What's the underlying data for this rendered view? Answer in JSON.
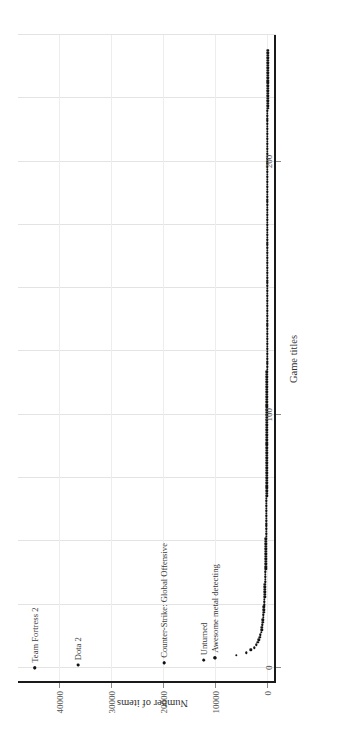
{
  "chart_data": {
    "type": "scatter",
    "title": "",
    "xlabel": "Game titles",
    "ylabel": "Number of items",
    "xlim": [
      -6,
      250
    ],
    "ylim": [
      -1500,
      48000
    ],
    "xticks": [
      0,
      100,
      200
    ],
    "xticklabels": [
      "0",
      "100",
      "200"
    ],
    "yticks": [
      0,
      10000,
      20000,
      30000,
      40000
    ],
    "yticklabels": [
      "0",
      "10000",
      "20000",
      "30000",
      "40000"
    ],
    "grid": true,
    "legend": null,
    "orientation": "rotated-90-clockwise",
    "annotations": [
      {
        "label": "Team Fortress 2",
        "x": 0,
        "y": 44800
      },
      {
        "label": "Dota 2",
        "x": 1,
        "y": 36400
      },
      {
        "label": "Counter-Strike: Global Offensive",
        "x": 2,
        "y": 19900
      },
      {
        "label": "Unturned",
        "x": 3,
        "y": 12400
      },
      {
        "label": "Awesome metal detecting",
        "x": 4,
        "y": 10200
      }
    ],
    "x": [
      0,
      1,
      2,
      3,
      4,
      5,
      6,
      7,
      8,
      9,
      10,
      11,
      12,
      13,
      14,
      15,
      16,
      17,
      18,
      19,
      20,
      21,
      22,
      23,
      24,
      25,
      26,
      27,
      28,
      29,
      30,
      31,
      32,
      33,
      34,
      35,
      36,
      37,
      38,
      39,
      40,
      41,
      42,
      43,
      44,
      45,
      46,
      47,
      48,
      49,
      50,
      51,
      52,
      53,
      54,
      55,
      56,
      57,
      58,
      59,
      60,
      61,
      62,
      63,
      64,
      65,
      66,
      67,
      68,
      69,
      70,
      71,
      72,
      73,
      74,
      75,
      76,
      77,
      78,
      79,
      80,
      81,
      82,
      83,
      84,
      85,
      86,
      87,
      88,
      89,
      90,
      91,
      92,
      93,
      94,
      95,
      96,
      97,
      98,
      99,
      100,
      101,
      102,
      103,
      104,
      105,
      106,
      107,
      108,
      109,
      110,
      111,
      112,
      113,
      114,
      115,
      116,
      117,
      118,
      119,
      120,
      121,
      122,
      123,
      124,
      125,
      126,
      127,
      128,
      129,
      130,
      131,
      132,
      133,
      134,
      135,
      136,
      137,
      138,
      139,
      140,
      141,
      142,
      143,
      144,
      145,
      146,
      147,
      148,
      149,
      150,
      151,
      152,
      153,
      154,
      155,
      156,
      157,
      158,
      159,
      160,
      161,
      162,
      163,
      164,
      165,
      166,
      167,
      168,
      169,
      170,
      171,
      172,
      173,
      174,
      175,
      176,
      177,
      178,
      179,
      180,
      181,
      182,
      183,
      184,
      185,
      186,
      187,
      188,
      189,
      190,
      191,
      192,
      193,
      194,
      195,
      196,
      197,
      198,
      199,
      200,
      201,
      202,
      203,
      204,
      205,
      206,
      207,
      208,
      209,
      210,
      211,
      212,
      213,
      214,
      215,
      216,
      217,
      218,
      219,
      220,
      221,
      222,
      223,
      224,
      225,
      226,
      227,
      228,
      229,
      230,
      231,
      232,
      233,
      234,
      235,
      236,
      237,
      238,
      239,
      240,
      241,
      242,
      243,
      244
    ],
    "y": [
      44800,
      36400,
      19900,
      12400,
      10200,
      6100,
      4200,
      3300,
      2700,
      2300,
      2000,
      1800,
      1620,
      1480,
      1360,
      1260,
      1180,
      1110,
      1050,
      1000,
      950,
      905,
      865,
      830,
      798,
      768,
      740,
      715,
      692,
      670,
      650,
      631,
      613,
      596,
      580,
      565,
      551,
      538,
      525,
      513,
      502,
      491,
      481,
      471,
      462,
      453,
      445,
      437,
      429,
      422,
      415,
      408,
      401,
      395,
      389,
      383,
      378,
      372,
      367,
      362,
      357,
      352,
      348,
      343,
      339,
      335,
      331,
      327,
      323,
      319,
      316,
      312,
      309,
      305,
      302,
      299,
      296,
      293,
      290,
      287,
      284,
      281,
      279,
      276,
      273,
      271,
      268,
      266,
      264,
      261,
      259,
      257,
      255,
      253,
      251,
      249,
      247,
      245,
      243,
      241,
      239,
      237,
      235,
      234,
      232,
      230,
      229,
      227,
      225,
      224,
      222,
      221,
      219,
      218,
      216,
      215,
      214,
      212,
      211,
      210,
      208,
      207,
      206,
      205,
      203,
      202,
      201,
      200,
      199,
      198,
      196,
      195,
      194,
      193,
      192,
      191,
      190,
      189,
      188,
      187,
      186,
      185,
      184,
      183,
      182,
      181,
      180,
      180,
      179,
      178,
      177,
      176,
      175,
      174,
      174,
      173,
      172,
      171,
      170,
      170,
      169,
      168,
      167,
      167,
      166,
      165,
      164,
      164,
      163,
      162,
      162,
      161,
      160,
      160,
      159,
      158,
      158,
      157,
      156,
      156,
      155,
      154,
      154,
      153,
      153,
      152,
      151,
      151,
      150,
      150,
      149,
      148,
      148,
      147,
      147,
      146,
      146,
      145,
      145,
      144,
      144,
      143,
      143,
      142,
      142,
      141,
      141,
      140,
      140,
      139,
      139,
      138,
      138,
      137,
      137,
      136,
      136,
      135,
      135,
      134,
      134,
      133,
      133,
      133,
      132,
      132,
      131,
      131,
      130,
      130,
      130,
      129,
      129,
      128,
      128,
      128,
      127,
      127,
      126,
      126,
      126,
      125,
      125,
      125,
      124
    ]
  }
}
